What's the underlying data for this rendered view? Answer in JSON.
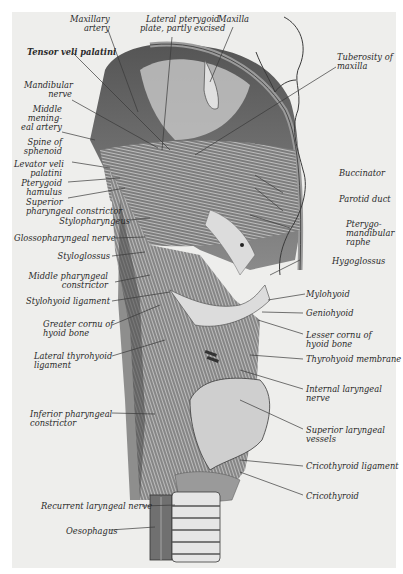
{
  "figure": {
    "labels_left": [
      {
        "id": "tensor",
        "text": "Tensor veli palatini"
      },
      {
        "id": "mandibular",
        "line1": "Mandibular",
        "line2": "nerve"
      },
      {
        "id": "meningeal",
        "line1": "Middle",
        "line2": "mening-",
        "line3": "eal artery"
      },
      {
        "id": "spine",
        "line1": "Spine of",
        "line2": "sphenoid"
      },
      {
        "id": "levator",
        "line1": "Levator veli",
        "line2": "palatini"
      },
      {
        "id": "hamulus",
        "line1": "Pterygoid",
        "line2": "hamulus"
      },
      {
        "id": "superior_constrictor",
        "line1": "Superior",
        "line2": "pharyngeal constrictor"
      },
      {
        "id": "stylopharyngeus",
        "text": "Stylopharyngeus"
      },
      {
        "id": "glossopharyngeal",
        "text": "Glossopharyngeal nerve"
      },
      {
        "id": "styloglossus",
        "text": "Styloglossus"
      },
      {
        "id": "middle_constrictor",
        "line1": "Middle pharyngeal",
        "line2": "constrictor"
      },
      {
        "id": "stylohyoid",
        "text": "Stylohyoid ligament"
      },
      {
        "id": "greater_cornu",
        "line1": "Greater cornu of",
        "line2": "hyoid bone"
      },
      {
        "id": "lateral_thyrohyoid",
        "line1": "Lateral thyrohyoid",
        "line2": "ligament"
      },
      {
        "id": "inferior_constrictor",
        "line1": "Inferior pharyngeal",
        "line2": "constrictor"
      },
      {
        "id": "recurrent",
        "text": "Recurrent laryngeal nerve"
      },
      {
        "id": "oesophagus",
        "text": "Oesophagus"
      }
    ],
    "labels_top": [
      {
        "id": "maxillary_artery",
        "line1": "Maxillary",
        "line2": "artery"
      },
      {
        "id": "lateral_pterygoid",
        "line1": "Lateral pterygoid",
        "line2": "plate, partly excised"
      },
      {
        "id": "maxilla",
        "text": "Maxilla"
      }
    ],
    "labels_right": [
      {
        "id": "tuberosity",
        "line1": "Tuberosity of",
        "line2": "maxilla"
      },
      {
        "id": "buccinator",
        "text": "Buccinator"
      },
      {
        "id": "parotid",
        "text": "Parotid duct"
      },
      {
        "id": "raphe",
        "line1": "Pterygo-",
        "line2": "mandibular",
        "line3": "raphe"
      },
      {
        "id": "hyoglossus",
        "text": "Hygoglossus"
      },
      {
        "id": "mylohyoid",
        "text": "Mylohyoid"
      },
      {
        "id": "geniohyoid",
        "text": "Geniohyoid"
      },
      {
        "id": "lesser_cornu",
        "line1": "Lesser cornu of",
        "line2": "hyoid bone"
      },
      {
        "id": "thyrohyoid_membrane",
        "text": "Thyrohyoid membrane"
      },
      {
        "id": "internal_laryngeal",
        "line1": "Internal laryngeal",
        "line2": "nerve"
      },
      {
        "id": "superior_laryngeal",
        "line1": "Superior laryngeal",
        "line2": "vessels"
      },
      {
        "id": "cricothyroid_ligament",
        "text": "Cricothyroid ligament"
      },
      {
        "id": "cricothyroid",
        "text": "Cricothyroid"
      }
    ]
  }
}
